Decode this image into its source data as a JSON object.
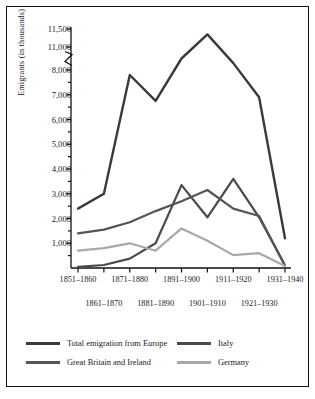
{
  "chart_data": {
    "type": "line",
    "title": "",
    "xlabel": "",
    "ylabel": "Emigrants (in thousands)",
    "grid": false,
    "legend_position": "bottom",
    "axis_break": {
      "between": [
        8000,
        11000
      ],
      "style": "zigzag"
    },
    "ylim": [
      0,
      11500
    ],
    "yticks": [
      1000,
      2000,
      3000,
      4000,
      5000,
      6000,
      7000,
      8000,
      11000,
      11500
    ],
    "ytick_labels": [
      "1,000",
      "2,000",
      "3,000",
      "4,000",
      "5,000",
      "6,000",
      "7,000",
      "8,000",
      "11,000",
      "11,500"
    ],
    "minor_ytick_step": 500,
    "categories": [
      "1851–1860",
      "1861–1870",
      "1871–1880",
      "1881–1890",
      "1891–1900",
      "1901–1910",
      "1911–1920",
      "1921–1930",
      "1931–1940"
    ],
    "xtick_rows": {
      "upper": [
        "1851–1860",
        "1871–1880",
        "1891–1900",
        "1911–1920",
        "1931–1940"
      ],
      "lower": [
        "1861–1870",
        "1881–1890",
        "1901–1910",
        "1921–1930"
      ]
    },
    "series": [
      {
        "name": "Total emigration from Europe",
        "color": "#3a3a3a",
        "width": 2.4,
        "values": [
          2400,
          3000,
          7800,
          6750,
          9500,
          11350,
          8900,
          6900,
          1200
        ]
      },
      {
        "name": "Italy",
        "color": "#4a4a4a",
        "width": 2.2,
        "values": [
          50,
          120,
          380,
          1000,
          3350,
          2050,
          3600,
          2050,
          100
        ]
      },
      {
        "name": "Great Britain and Ireland",
        "color": "#555555",
        "width": 2.2,
        "values": [
          1400,
          1550,
          1850,
          2300,
          2700,
          3150,
          2400,
          2100,
          100
        ]
      },
      {
        "name": "Germany",
        "color": "#a8a8a8",
        "width": 2.2,
        "values": [
          700,
          800,
          1000,
          700,
          1600,
          1100,
          520,
          600,
          80
        ]
      }
    ]
  },
  "legend": {
    "entries": [
      {
        "label": "Total emigration from Europe",
        "color": "#3a3a3a"
      },
      {
        "label": "Italy",
        "color": "#4a4a4a"
      },
      {
        "label": "Great Britain and Ireland",
        "color": "#555555"
      },
      {
        "label": "Germany",
        "color": "#a8a8a8"
      }
    ]
  }
}
